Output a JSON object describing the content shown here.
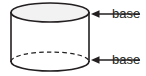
{
  "figure": {
    "kind": "geometry-diagram",
    "width": 146,
    "height": 76,
    "background_color": "#ffffff"
  },
  "shape": {
    "name": "cylinder",
    "stroke_color": "#231f20",
    "top_face_fill": "#f2f2f2",
    "body_fill": "#ffffff",
    "hidden_edge_style": "dashed",
    "geometry": {
      "center_x": 50,
      "radius_x": 39,
      "radius_y": 9.5,
      "top_center_y": 12.5,
      "bottom_center_y": 61.5
    }
  },
  "annotations": [
    {
      "id": "base-top",
      "label": "base",
      "target": "top-face",
      "arrow_direction": "left",
      "arrow_from_x": 140,
      "arrow_to_x": 91,
      "arrow_y": 14
    },
    {
      "id": "base-bottom",
      "label": "base",
      "target": "bottom-face",
      "arrow_direction": "left",
      "arrow_from_x": 140,
      "arrow_to_x": 91,
      "arrow_y": 60
    }
  ],
  "labels": {
    "base_top": "base",
    "base_bottom": "base"
  },
  "colors": {
    "ink": "#231f20",
    "top_fill": "#f2f2f2",
    "background": "#ffffff"
  }
}
